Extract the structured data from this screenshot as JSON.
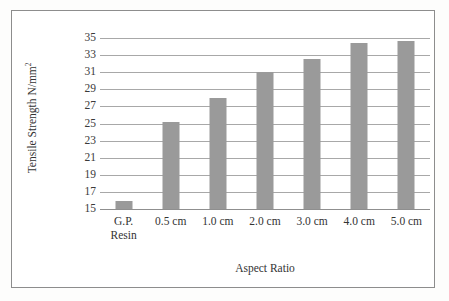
{
  "chart_data": {
    "type": "bar",
    "title": "",
    "xlabel": "Aspect Ratio",
    "ylabel": "Tensile Strength N/mm²",
    "ylabel_base": "Tensile Strength N/mm",
    "ylabel_sup": "2",
    "categories": [
      "G.P. Resin",
      "0.5 cm",
      "1.0 cm",
      "2.0 cm",
      "3.0 cm",
      "4.0 cm",
      "5.0 cm"
    ],
    "category_lines": [
      [
        "G.P.",
        "Resin"
      ],
      [
        "0.5 cm",
        ""
      ],
      [
        "1.0 cm",
        ""
      ],
      [
        "2.0 cm",
        ""
      ],
      [
        "3.0 cm",
        ""
      ],
      [
        "4.0 cm",
        ""
      ],
      [
        "5.0 cm",
        ""
      ]
    ],
    "values": [
      15.9,
      25.2,
      28.0,
      31.0,
      32.6,
      34.4,
      34.7
    ],
    "ylim": [
      15,
      35
    ],
    "ytick_step": 2,
    "yticks": [
      15,
      17,
      19,
      21,
      23,
      25,
      27,
      29,
      31,
      33,
      35
    ],
    "ytick_labels": [
      "15",
      "17",
      "19",
      "21",
      "23",
      "25",
      "27",
      "29",
      "31",
      "33",
      "35"
    ],
    "grid": true,
    "grid_axis": "y",
    "legend": false,
    "legend_position": "none",
    "bar_color": "#9a9a9a",
    "grid_color": "#a8a8a8",
    "frame_color": "#8d8d8d",
    "background": "#ffffff",
    "text_color": "#333333"
  }
}
